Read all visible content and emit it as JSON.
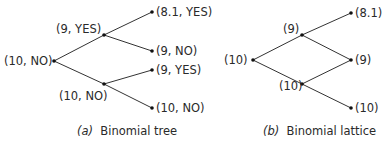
{
  "panel_a": {
    "caption_letter": "(a)",
    "caption_text": "Binomial tree",
    "nodes": {
      "root": "(10, NO)",
      "up": "(9, YES)",
      "down": "(10, NO)",
      "up_up": "(8.1, YES)",
      "up_down": "(9, NO)",
      "down_up": "(9, YES)",
      "down_down": "(10, NO)"
    }
  },
  "panel_b": {
    "caption_letter": "(b)",
    "caption_text": "Binomial lattice",
    "nodes": {
      "root": "(10)",
      "up": "(9)",
      "down": "(10)",
      "up_up": "(8.1)",
      "middle": "(9)",
      "down_down": "(10)"
    }
  },
  "colors": {
    "line": "#333333",
    "text": "#2a2a2a"
  }
}
